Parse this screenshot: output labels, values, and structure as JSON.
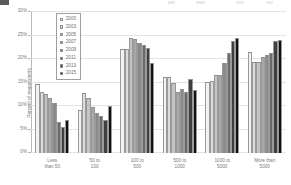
{
  "chart_data": {
    "type": "bar",
    "title": "",
    "subtitle": "",
    "xlabel": "",
    "ylabel": "Percent of respondents",
    "ylim": [
      0,
      30
    ],
    "ytick_values": [
      0,
      5,
      10,
      15,
      20,
      25,
      30
    ],
    "ytick_labels": [
      "0%",
      "5%",
      "10%",
      "15%",
      "20%",
      "25%",
      "30%"
    ],
    "grid": true,
    "legend_position": "top-left-inside",
    "categories": [
      "Less than 50",
      "50 to 100",
      "100 to 500",
      "500 to 1000",
      "1000 to 5000",
      "More than 5000"
    ],
    "category_lines": [
      [
        "Less",
        "than 50"
      ],
      [
        "50 to",
        "100"
      ],
      [
        "100 to",
        "500"
      ],
      [
        "500 to",
        "1000"
      ],
      [
        "1000 to",
        "5000"
      ],
      [
        "More than",
        "5000"
      ]
    ],
    "series": [
      {
        "name": "2000",
        "color": "#f2f2f2",
        "values": [
          14.7,
          9.2,
          22.1,
          16.1,
          15.2,
          21.5
        ]
      },
      {
        "name": "2003",
        "color": "#dcdcdc",
        "values": [
          13.0,
          12.7,
          22.2,
          16.1,
          15.3,
          19.3
        ]
      },
      {
        "name": "2005",
        "color": "#c4c4c4",
        "values": [
          12.6,
          11.8,
          24.4,
          14.9,
          16.5,
          19.4
        ]
      },
      {
        "name": "2007",
        "color": "#a8a8a8",
        "values": [
          11.8,
          9.7,
          24.3,
          13.0,
          16.6,
          20.5
        ]
      },
      {
        "name": "2009",
        "color": "#8a8a8a",
        "values": [
          10.6,
          8.5,
          23.4,
          13.6,
          19.2,
          20.8
        ]
      },
      {
        "name": "2011",
        "color": "#6a6a6a",
        "values": [
          6.6,
          7.8,
          22.9,
          13.0,
          21.3,
          21.3
        ]
      },
      {
        "name": "2013",
        "color": "#3f3f3f",
        "values": [
          5.5,
          7.0,
          22.3,
          15.7,
          23.8,
          23.8
        ]
      },
      {
        "name": "2015",
        "color": "#111111",
        "values": [
          7.0,
          9.9,
          19.2,
          13.4,
          24.5,
          24.1
        ]
      }
    ],
    "series_2015_extra": {
      "note": "",
      "values_tail": [
        17.2,
        24.2,
        25.2
      ]
    }
  },
  "legend": {
    "entries": [
      "2000",
      "2003",
      "2005",
      "2007",
      "2009",
      "2011",
      "2013",
      "2015"
    ]
  }
}
